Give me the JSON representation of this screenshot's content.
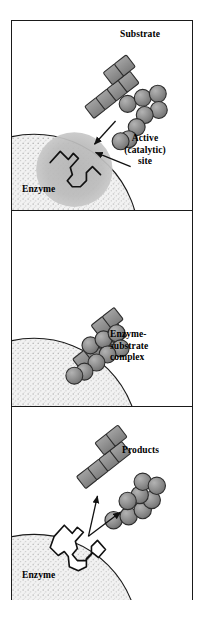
{
  "figure": {
    "panel_count": 3,
    "colors": {
      "ink": "#1a1a1a",
      "enzyme_body": "#efefef",
      "enzyme_stipple": "#9a9a9a",
      "active_site_halo": "#b9b9b9",
      "molecule_fill": "#8e8e8e",
      "molecule_stroke": "#2b2b2b",
      "background": "#ffffff"
    }
  },
  "panels": [
    {
      "id": "panel-binding",
      "index": 1,
      "labels": {
        "substrate": "Substrate",
        "active_site_line1": "Active",
        "active_site_line2": "(catalytic)",
        "active_site_line3": "site",
        "enzyme": "Enzyme"
      },
      "arrows": [
        {
          "name": "substrate-approach-arrow",
          "from": [
            105,
            95
          ],
          "to": [
            84,
            120
          ]
        },
        {
          "name": "active-site-pointer-arrow",
          "from": [
            116,
            113
          ],
          "to": [
            82,
            137
          ]
        }
      ],
      "molecule": {
        "name": "substrate",
        "blocks": 6,
        "spheres": 8,
        "shape": "branched"
      }
    },
    {
      "id": "panel-complex",
      "index": 2,
      "labels": {
        "complex_line1": "Enzyme-",
        "complex_line2": "substrate",
        "complex_line3": "complex"
      },
      "molecule": {
        "name": "enzyme-substrate-complex",
        "blocks": 6,
        "spheres": 8,
        "shape": "bound"
      }
    },
    {
      "id": "panel-products",
      "index": 3,
      "labels": {
        "products": "Products",
        "enzyme": "Enzyme"
      },
      "arrows": [
        {
          "name": "product-release-arrow-left",
          "from": [
            80,
            127
          ],
          "to": [
            84,
            90
          ]
        },
        {
          "name": "product-release-arrow-right",
          "from": [
            80,
            127
          ],
          "to": [
            110,
            103
          ]
        }
      ],
      "molecules": [
        {
          "name": "product-blocks",
          "blocks": 6
        },
        {
          "name": "product-spheres",
          "spheres": 8
        }
      ]
    }
  ]
}
